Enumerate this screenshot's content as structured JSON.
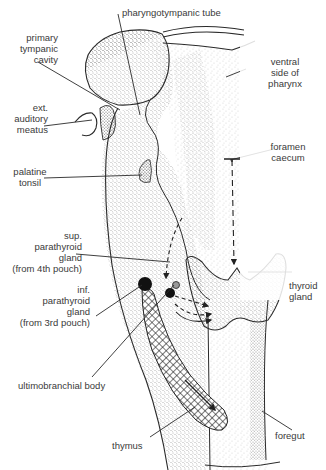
{
  "diagram": {
    "labels": {
      "pharyngotympanic_tube": "pharyngotympanic tube",
      "primary_tympanic_cavity": "primary\ntympanic\ncavity",
      "ventral_side_of_pharynx": "ventral\nside of\npharynx",
      "ext_auditory_meatus": "ext.\nauditory\nmeatus",
      "foramen_caecum": "foramen\ncaecum",
      "palatine_tonsil": "palatine\ntonsil",
      "sup_parathyroid_gland": "sup.\nparathyroid\ngland\n(from 4th pouch)",
      "inf_parathyroid_gland": "inf.\nparathyroid\ngland\n(from 3rd pouch)",
      "thyroid_gland": "thyroid\ngland",
      "ultimobranchial_body": "ultimobranchial body",
      "thymus": "thymus",
      "foregut": "foregut"
    },
    "colors": {
      "line": "#2a2a2a",
      "stipple": "#555555",
      "text": "#3a3a3a",
      "gland_fill": "#111111",
      "background": "#ffffff"
    }
  }
}
